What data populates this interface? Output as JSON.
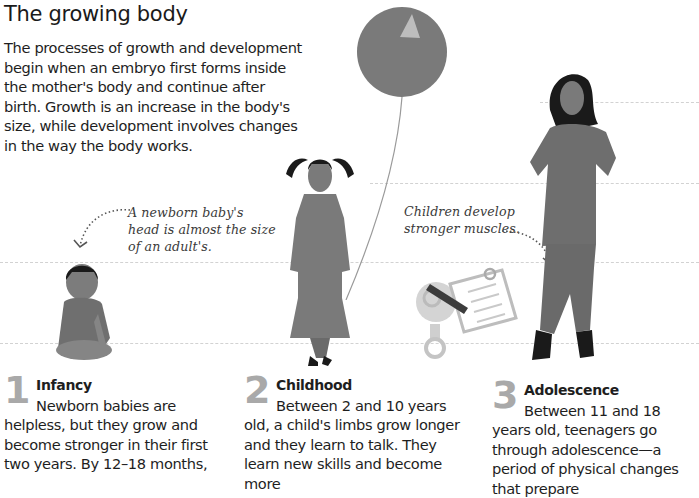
{
  "page": {
    "title": "The growing body",
    "intro": "The processes of growth and development begin when an embryo first forms inside the mother's body and continue after birth. Growth is an increase in the body's size, while development involves changes in the way the body works."
  },
  "annotations": {
    "baby_head": "A newborn baby's head is almost the size of an adult's.",
    "muscles": "Children develop stronger muscles."
  },
  "colors": {
    "figure_gray": "#7a7a7a",
    "hair": "#1a1a1a",
    "dash": "#d2d2d2",
    "stage_number": "#a9a9a9"
  },
  "stages": [
    {
      "number": "1",
      "heading": "Infancy",
      "text": "Newborn babies are helpless, but they grow and become stronger in their first two years. By 12–18 months,"
    },
    {
      "number": "2",
      "heading": "Childhood",
      "text": "Between 2 and 10 years old, a child's limbs grow longer and they learn to talk. They learn new skills and become more"
    },
    {
      "number": "3",
      "heading": "Adolescence",
      "text": "Between 11 and 18 years old, teenagers go through adolescence—a period of physical changes that prepare"
    }
  ],
  "icons": [
    "balloon-icon",
    "baby-figure",
    "child-figure",
    "teen-figure",
    "robot-clipboard-icon"
  ]
}
